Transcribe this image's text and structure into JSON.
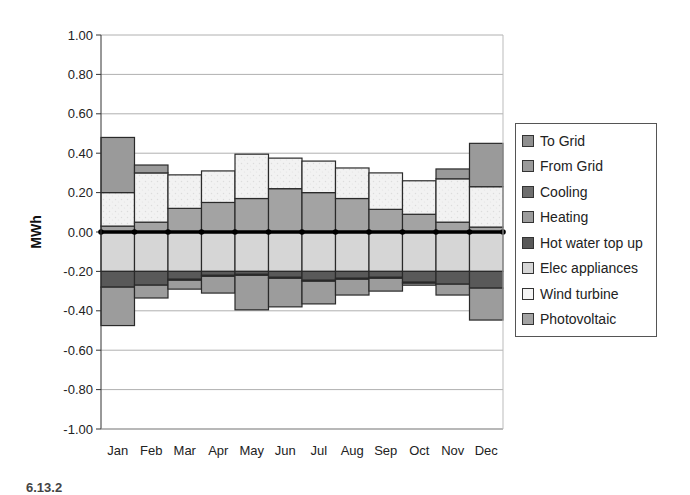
{
  "chart_data": {
    "type": "bar",
    "subtype": "stacked",
    "title": "",
    "xlabel": "",
    "ylabel": "MWh",
    "ylim": [
      -1.0,
      1.0
    ],
    "yticks": [
      "1.00",
      "0.80",
      "0.60",
      "0.40",
      "0.20",
      "0.00",
      "-0.20",
      "-0.40",
      "-0.60",
      "-0.80",
      "-1.00"
    ],
    "grid": true,
    "legend_position": "right",
    "categories": [
      "Jan",
      "Feb",
      "Mar",
      "Apr",
      "May",
      "Jun",
      "Jul",
      "Aug",
      "Sep",
      "Oct",
      "Nov",
      "Dec"
    ],
    "series": [
      {
        "name": "To Grid",
        "values": [
          0,
          0,
          0,
          0,
          0,
          0,
          0,
          0,
          0,
          0,
          0,
          0
        ],
        "color": "#8f8f8f"
      },
      {
        "name": "From Grid",
        "values": [
          0.28,
          0.04,
          0,
          0,
          0,
          0,
          0,
          0,
          0,
          0,
          0.05,
          0.22
        ],
        "color": "#9a9a9a"
      },
      {
        "name": "Cooling",
        "values": [
          0,
          0,
          -0.005,
          -0.005,
          -0.005,
          -0.005,
          -0.005,
          -0.005,
          -0.005,
          -0.005,
          0,
          0
        ],
        "color": "#6e6e6e"
      },
      {
        "name": "Heating",
        "values": [
          -0.195,
          -0.065,
          -0.045,
          -0.085,
          -0.175,
          -0.145,
          -0.115,
          -0.08,
          -0.065,
          -0.01,
          -0.055,
          -0.162
        ],
        "color": "#9c9c9c"
      },
      {
        "name": "Hot water top up",
        "values": [
          -0.08,
          -0.07,
          -0.04,
          -0.02,
          -0.015,
          -0.03,
          -0.045,
          -0.035,
          -0.03,
          -0.055,
          -0.065,
          -0.085
        ],
        "color": "#595959"
      },
      {
        "name": "Elec appliances",
        "values": [
          -0.2,
          -0.2,
          -0.2,
          -0.2,
          -0.2,
          -0.2,
          -0.2,
          -0.2,
          -0.2,
          -0.2,
          -0.2,
          -0.2
        ],
        "color": "#d6d6d6"
      },
      {
        "name": "Wind turbine",
        "values": [
          0.17,
          0.25,
          0.17,
          0.16,
          0.225,
          0.155,
          0.16,
          0.155,
          0.185,
          0.17,
          0.22,
          0.205
        ],
        "color": "#f0f0f0"
      },
      {
        "name": "Photovoltaic",
        "values": [
          0.03,
          0.05,
          0.12,
          0.15,
          0.17,
          0.22,
          0.2,
          0.17,
          0.115,
          0.09,
          0.05,
          0.025
        ],
        "color": "#a3a3a3"
      }
    ],
    "totals_positive": [
      0.48,
      0.34,
      0.29,
      0.31,
      0.395,
      0.375,
      0.36,
      0.325,
      0.3,
      0.26,
      0.32,
      0.45
    ],
    "totals_negative": [
      -0.475,
      -0.335,
      -0.29,
      -0.31,
      -0.395,
      -0.38,
      -0.365,
      -0.32,
      -0.3,
      -0.265,
      -0.32,
      -0.447
    ]
  },
  "legend": {
    "items": [
      {
        "label": "To Grid",
        "color": "#8f8f8f"
      },
      {
        "label": "From Grid",
        "color": "#9a9a9a"
      },
      {
        "label": "Cooling",
        "color": "#6e6e6e"
      },
      {
        "label": "Heating",
        "color": "#9c9c9c"
      },
      {
        "label": "Hot water top up",
        "color": "#595959"
      },
      {
        "label": "Elec appliances",
        "color": "#d6d6d6"
      },
      {
        "label": "Wind turbine",
        "color": "#f4f4f4"
      },
      {
        "label": "Photovoltaic",
        "color": "#a3a3a3"
      }
    ]
  },
  "footer": {
    "note": "6.13.2"
  }
}
